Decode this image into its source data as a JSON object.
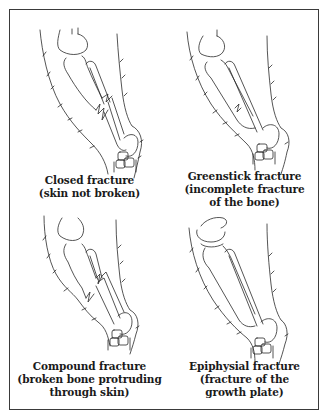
{
  "figure": {
    "panels": [
      {
        "id": "closed",
        "title": "Closed fracture",
        "lines": [
          "(skin not broken)"
        ]
      },
      {
        "id": "greenstick",
        "title": "Greenstick fracture",
        "lines": [
          "(incomplete fracture",
          "of the bone)"
        ]
      },
      {
        "id": "compound",
        "title": "Compound fracture",
        "lines": [
          "(broken bone protruding",
          "through skin)"
        ]
      },
      {
        "id": "epiphysial",
        "title": "Epiphysial fracture",
        "lines": [
          "(fracture of the",
          "growth plate)"
        ]
      }
    ],
    "colors": {
      "line": "#2a2a2a",
      "border": "#3a3a3a",
      "background": "#ffffff"
    }
  }
}
